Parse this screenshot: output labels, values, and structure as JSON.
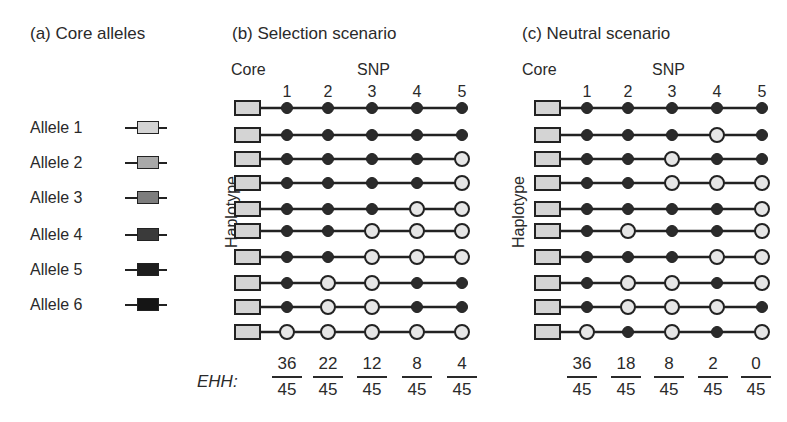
{
  "panel_a": {
    "title": "(a) Core alleles",
    "alleles": [
      {
        "label": "Allele 1",
        "color": "#d4d4d4"
      },
      {
        "label": "Allele 2",
        "color": "#a9a9a9"
      },
      {
        "label": "Allele 3",
        "color": "#7d7d7d"
      },
      {
        "label": "Allele 4",
        "color": "#3a3a3a"
      },
      {
        "label": "Allele 5",
        "color": "#1e1e1e"
      },
      {
        "label": "Allele 6",
        "color": "#151515"
      }
    ]
  },
  "panel_b": {
    "title": "(b) Selection scenario",
    "core_label": "Core",
    "snp_label": "SNP",
    "snp_numbers": [
      "1",
      "2",
      "3",
      "4",
      "5"
    ],
    "y_label": "Haplotype",
    "ehh_label": "EHH:",
    "haplotypes": [
      [
        1,
        1,
        1,
        1,
        1
      ],
      [
        1,
        1,
        1,
        1,
        1
      ],
      [
        1,
        1,
        1,
        1,
        0
      ],
      [
        1,
        1,
        1,
        1,
        0
      ],
      [
        1,
        1,
        1,
        0,
        0
      ],
      [
        1,
        1,
        0,
        0,
        0
      ],
      [
        1,
        1,
        0,
        0,
        0
      ],
      [
        1,
        0,
        0,
        1,
        1
      ],
      [
        1,
        0,
        0,
        1,
        1
      ],
      [
        0,
        0,
        0,
        0,
        0
      ]
    ],
    "ehh": [
      {
        "num": "36",
        "den": "45"
      },
      {
        "num": "22",
        "den": "45"
      },
      {
        "num": "12",
        "den": "45"
      },
      {
        "num": "8",
        "den": "45"
      },
      {
        "num": "4",
        "den": "45"
      }
    ]
  },
  "panel_c": {
    "title": "(c)  Neutral scenario",
    "core_label": "Core",
    "snp_label": "SNP",
    "snp_numbers": [
      "1",
      "2",
      "3",
      "4",
      "5"
    ],
    "y_label": "Haplotype",
    "haplotypes": [
      [
        1,
        1,
        1,
        1,
        1
      ],
      [
        1,
        1,
        1,
        0,
        1
      ],
      [
        1,
        1,
        0,
        1,
        1
      ],
      [
        1,
        1,
        0,
        0,
        0
      ],
      [
        1,
        1,
        1,
        1,
        0
      ],
      [
        1,
        0,
        1,
        1,
        0
      ],
      [
        1,
        1,
        1,
        0,
        0
      ],
      [
        1,
        0,
        0,
        1,
        0
      ],
      [
        1,
        0,
        0,
        0,
        1
      ],
      [
        0,
        1,
        0,
        1,
        0
      ]
    ],
    "ehh": [
      {
        "num": "36",
        "den": "45"
      },
      {
        "num": "18",
        "den": "45"
      },
      {
        "num": "8",
        "den": "45"
      },
      {
        "num": "2",
        "den": "45"
      },
      {
        "num": "0",
        "den": "45"
      }
    ]
  },
  "colors": {
    "derived_filled": "#2b2b2b",
    "ancestral_open": "#e6e6e6",
    "core_box": "#d4d4d4",
    "line": "#222222"
  }
}
